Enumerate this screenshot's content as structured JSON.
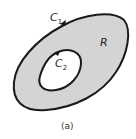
{
  "diagram": {
    "caption": "(a)",
    "region_label": "R",
    "outer_curve": {
      "label": "C",
      "subscript": "1"
    },
    "inner_curve": {
      "label": "C",
      "subscript": "2"
    },
    "colors": {
      "region_fill": "#d4d4d4",
      "curve_stroke": "#1a1a1a",
      "hole_fill": "#ffffff",
      "background": "#ffffff"
    }
  }
}
